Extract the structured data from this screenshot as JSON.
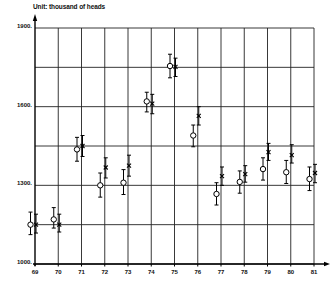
{
  "chart_data": {
    "type": "scatter",
    "title": "Unit: thousand of heads",
    "xlabel": "",
    "ylabel": "",
    "unit_label": "Unit: thousand of heads",
    "categories": [
      "69",
      "70",
      "71",
      "72",
      "73",
      "74",
      "75",
      "76",
      "77",
      "78",
      "79",
      "80",
      "81"
    ],
    "y_tick_labels": [
      "1000.",
      "1300.",
      "1600.",
      "1900."
    ],
    "y_ticks": [
      1000,
      1300,
      1600,
      1900
    ],
    "y_gridlines": [
      1000,
      1150,
      1300,
      1450,
      1600,
      1750,
      1900
    ],
    "ylim": [
      1000,
      1900
    ],
    "grid": true,
    "legend": "none",
    "series": [
      {
        "name": "circle (open markers)",
        "marker": "open-circle",
        "values": [
          1150,
          1170,
          1437,
          1300,
          1310,
          1620,
          1755,
          1490,
          1267,
          1313,
          1362,
          1350,
          1324
        ],
        "err_low": [
          1112,
          1137,
          1392,
          1255,
          1265,
          1580,
          1710,
          1447,
          1225,
          1270,
          1320,
          1307,
          1280
        ],
        "err_high": [
          1198,
          1215,
          1483,
          1347,
          1360,
          1655,
          1800,
          1530,
          1310,
          1355,
          1405,
          1395,
          1370
        ]
      },
      {
        "name": "cross (x markers)",
        "marker": "x",
        "values": [
          1150,
          1150,
          1450,
          1368,
          1375,
          1612,
          1752,
          1565,
          1335,
          1343,
          1427,
          1415,
          1347
        ],
        "err_low": [
          1118,
          1122,
          1410,
          1328,
          1335,
          1573,
          1715,
          1530,
          1300,
          1312,
          1395,
          1385,
          1310
        ],
        "err_high": [
          1190,
          1190,
          1490,
          1405,
          1415,
          1647,
          1785,
          1600,
          1370,
          1375,
          1460,
          1455,
          1380
        ]
      }
    ]
  }
}
